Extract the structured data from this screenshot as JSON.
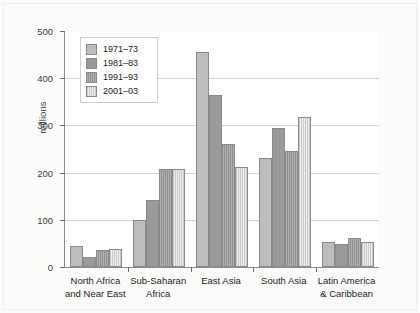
{
  "chart_data": {
    "type": "bar",
    "title": "",
    "subtitle": "",
    "xlabel": "",
    "ylabel": "millions",
    "ylim": [
      0,
      500
    ],
    "yticks": [
      0,
      100,
      200,
      300,
      400,
      500
    ],
    "ytick_labels": [
      "0",
      "100",
      "200",
      "300",
      "400",
      "500"
    ],
    "grid": "horizontal",
    "legend_position": "upper-left-inside",
    "categories": [
      "North Africa\nand Near East",
      "Sub-Saharan\nAfrica",
      "East Asia",
      "South Asia",
      "Latin America\n& Caribbean"
    ],
    "series": [
      {
        "name": "1971–73",
        "color": "#bdbdbd",
        "values": [
          45,
          100,
          455,
          230,
          52
        ]
      },
      {
        "name": "1981–83",
        "color": "#9a9a9a",
        "values": [
          22,
          142,
          365,
          295,
          48
        ]
      },
      {
        "name": "1991–93",
        "color": "#8f8f8f",
        "values": [
          36,
          208,
          260,
          245,
          62
        ]
      },
      {
        "name": "2001–03",
        "color": "#ececec",
        "values": [
          38,
          208,
          212,
          318,
          53
        ]
      }
    ]
  }
}
